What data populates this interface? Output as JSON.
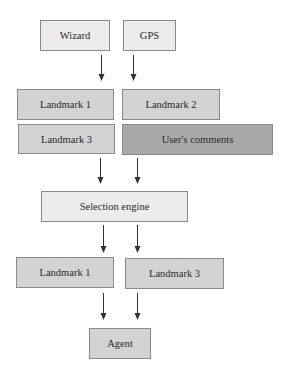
{
  "diagram": {
    "type": "flowchart",
    "inputs": [
      {
        "id": "wizard",
        "label": "Wizard"
      },
      {
        "id": "gps",
        "label": "GPS"
      }
    ],
    "candidates": [
      {
        "id": "landmark1",
        "label": "Landmark 1"
      },
      {
        "id": "landmark2",
        "label": "Landmark 2"
      },
      {
        "id": "landmark3",
        "label": "Landmark 3"
      },
      {
        "id": "comments",
        "label": "User's comments"
      }
    ],
    "engine": {
      "id": "selection",
      "label": "Selection engine"
    },
    "selected": [
      {
        "id": "sel_landmark1",
        "label": "Landmark 1"
      },
      {
        "id": "sel_landmark3",
        "label": "Landmark 3"
      }
    ],
    "output": {
      "id": "agent",
      "label": "Agent"
    },
    "edges": [
      [
        "Wizard",
        "Landmark 1 / Landmark 2 group"
      ],
      [
        "GPS",
        "Landmark 1 / Landmark 2 group"
      ],
      [
        "Landmark 3 / User's comments group",
        "Selection engine"
      ],
      [
        "Selection engine",
        "Landmark 1 / Landmark 3 (selected)"
      ],
      [
        "Landmark 1 / Landmark 3 (selected)",
        "Agent"
      ]
    ],
    "colors": {
      "light_fill": "#ececec",
      "mid_fill": "#d3d3d3",
      "dark_fill": "#a9a9a9",
      "border": "#8a8a8a",
      "arrow": "#333333"
    }
  }
}
